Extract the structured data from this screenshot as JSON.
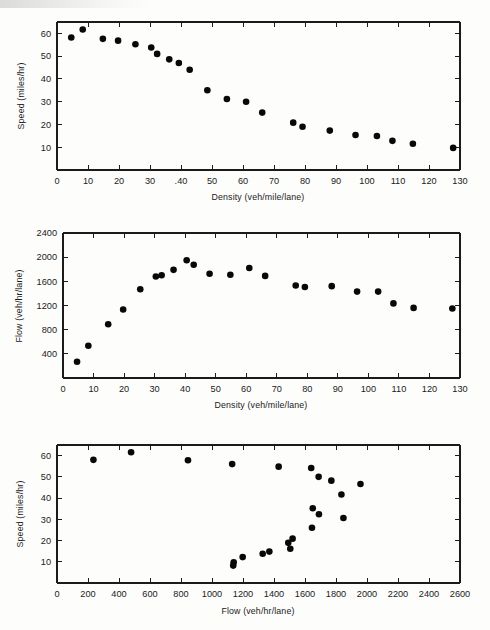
{
  "figure": {
    "background_color": "#fdfdfc",
    "marker_color": "#080808",
    "axis_color": "#1b1b1b"
  },
  "panels": [
    {
      "name": "speed-density",
      "xlabel": "Density (veh/mile/lane)",
      "ylabel": "Speed (miles/hr)",
      "xticks": [
        "0",
        "10",
        "20",
        "30",
        ".40",
        "50",
        "60",
        "70",
        "80",
        "90",
        "100",
        "110",
        "120",
        "130"
      ],
      "yticks": [
        "10",
        "20",
        "30",
        "40",
        "50",
        "60"
      ]
    },
    {
      "name": "flow-density",
      "xlabel": "Density (veh/mile/lane)",
      "ylabel": "Flow (veh/hr/lane)",
      "xticks": [
        "0",
        "10",
        "20",
        "30",
        "40",
        "50",
        "60",
        "70",
        "80",
        "90",
        "100",
        "110",
        "120",
        "130"
      ],
      "yticks": [
        "400",
        "800",
        "1200",
        "1600",
        "2000",
        "2400"
      ]
    },
    {
      "name": "speed-flow",
      "xlabel": "Flow (veh/hr/lane)",
      "ylabel": "Speed (miles/hr)",
      "xticks": [
        "0",
        "200",
        "400",
        "600",
        "800",
        "1000",
        "1200",
        "1400",
        "1600",
        "1800",
        "2000",
        "2200",
        "2400",
        "2600"
      ],
      "yticks": [
        "10",
        "20",
        "30",
        "40",
        "50",
        "60"
      ]
    }
  ],
  "chart_data": [
    {
      "type": "scatter",
      "title": "",
      "xlabel": "Density (veh/mile/lane)",
      "ylabel": "Speed (miles/hr)",
      "xlim": [
        0,
        130
      ],
      "ylim": [
        0,
        65
      ],
      "xticks": [
        0,
        10,
        20,
        30,
        40,
        50,
        60,
        70,
        80,
        90,
        100,
        110,
        120,
        130
      ],
      "yticks": [
        10,
        20,
        30,
        40,
        50,
        60
      ],
      "grid": false,
      "legend": "none",
      "points": [
        {
          "x": 4.6,
          "y": 58.2
        },
        {
          "x": 8.3,
          "y": 61.7
        },
        {
          "x": 14.8,
          "y": 57.6
        },
        {
          "x": 19.7,
          "y": 56.8
        },
        {
          "x": 25.3,
          "y": 55.2
        },
        {
          "x": 30.4,
          "y": 53.8
        },
        {
          "x": 32.3,
          "y": 51.0
        },
        {
          "x": 36.2,
          "y": 48.6
        },
        {
          "x": 39.3,
          "y": 47.0
        },
        {
          "x": 42.8,
          "y": 44.0
        },
        {
          "x": 48.5,
          "y": 35.0
        },
        {
          "x": 54.8,
          "y": 31.2
        },
        {
          "x": 61.0,
          "y": 30.0
        },
        {
          "x": 66.2,
          "y": 25.2
        },
        {
          "x": 76.2,
          "y": 20.8
        },
        {
          "x": 79.2,
          "y": 19.0
        },
        {
          "x": 88.0,
          "y": 17.3
        },
        {
          "x": 96.3,
          "y": 15.4
        },
        {
          "x": 103.2,
          "y": 14.9
        },
        {
          "x": 108.2,
          "y": 12.8
        },
        {
          "x": 114.8,
          "y": 11.5
        },
        {
          "x": 127.8,
          "y": 9.7
        }
      ]
    },
    {
      "type": "scatter",
      "title": "",
      "xlabel": "Density (veh/mile/lane)",
      "ylabel": "Flow (veh/hr/lane)",
      "xlim": [
        0,
        130
      ],
      "ylim": [
        0,
        2400
      ],
      "xticks": [
        0,
        10,
        20,
        30,
        40,
        50,
        60,
        70,
        80,
        90,
        100,
        110,
        120,
        130
      ],
      "yticks": [
        400,
        800,
        1200,
        1600,
        2000,
        2400
      ],
      "grid": false,
      "legend": "none",
      "points": [
        {
          "x": 4.6,
          "y": 268
        },
        {
          "x": 8.3,
          "y": 535
        },
        {
          "x": 14.8,
          "y": 890
        },
        {
          "x": 19.7,
          "y": 1135
        },
        {
          "x": 25.3,
          "y": 1470
        },
        {
          "x": 30.4,
          "y": 1680
        },
        {
          "x": 32.3,
          "y": 1700
        },
        {
          "x": 36.2,
          "y": 1790
        },
        {
          "x": 40.5,
          "y": 1950
        },
        {
          "x": 42.8,
          "y": 1875
        },
        {
          "x": 48.0,
          "y": 1725
        },
        {
          "x": 54.8,
          "y": 1710
        },
        {
          "x": 61.0,
          "y": 1820
        },
        {
          "x": 66.2,
          "y": 1690
        },
        {
          "x": 76.2,
          "y": 1530
        },
        {
          "x": 79.2,
          "y": 1505
        },
        {
          "x": 88.0,
          "y": 1520
        },
        {
          "x": 96.3,
          "y": 1430
        },
        {
          "x": 103.2,
          "y": 1430
        },
        {
          "x": 108.2,
          "y": 1235
        },
        {
          "x": 114.8,
          "y": 1160
        },
        {
          "x": 127.5,
          "y": 1150
        }
      ]
    },
    {
      "type": "scatter",
      "title": "",
      "xlabel": "Flow (veh/hr/lane)",
      "ylabel": "Speed (miles/hr)",
      "xlim": [
        0,
        2600
      ],
      "ylim": [
        0,
        65
      ],
      "xticks": [
        0,
        200,
        400,
        600,
        800,
        1000,
        1200,
        1400,
        1600,
        1800,
        2000,
        2200,
        2400,
        2600
      ],
      "yticks": [
        10,
        20,
        30,
        40,
        50,
        60
      ],
      "grid": false,
      "legend": "none",
      "points": [
        {
          "x": 235,
          "y": 58.0
        },
        {
          "x": 478,
          "y": 61.6
        },
        {
          "x": 845,
          "y": 57.8
        },
        {
          "x": 1130,
          "y": 56.0
        },
        {
          "x": 1430,
          "y": 54.8
        },
        {
          "x": 1640,
          "y": 54.2
        },
        {
          "x": 1688,
          "y": 50.0
        },
        {
          "x": 1770,
          "y": 48.2
        },
        {
          "x": 1958,
          "y": 46.6
        },
        {
          "x": 1835,
          "y": 41.7
        },
        {
          "x": 1650,
          "y": 35.2
        },
        {
          "x": 1690,
          "y": 32.4
        },
        {
          "x": 1848,
          "y": 30.6
        },
        {
          "x": 1645,
          "y": 26.0
        },
        {
          "x": 1520,
          "y": 20.9
        },
        {
          "x": 1492,
          "y": 18.9
        },
        {
          "x": 1505,
          "y": 16.1
        },
        {
          "x": 1370,
          "y": 14.8
        },
        {
          "x": 1327,
          "y": 13.8
        },
        {
          "x": 1198,
          "y": 12.2
        },
        {
          "x": 1140,
          "y": 9.8
        },
        {
          "x": 1137,
          "y": 8.2
        }
      ]
    }
  ]
}
